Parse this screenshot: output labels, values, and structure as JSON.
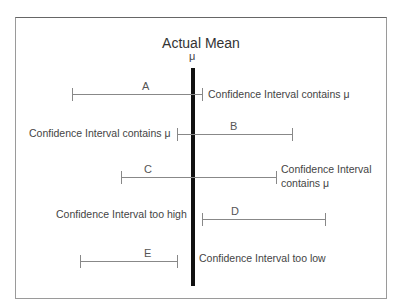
{
  "figure": {
    "title": "Actual Mean",
    "mean_symbol": "μ",
    "intervals": [
      {
        "id": "A",
        "label": "A",
        "note": "Confidence Interval contains μ",
        "note_side": "right",
        "contains_mean": true
      },
      {
        "id": "B",
        "label": "B",
        "note": "Confidence Interval contains μ",
        "note_side": "left",
        "contains_mean": true
      },
      {
        "id": "C",
        "label": "C",
        "note_line1": "Confidence Interval",
        "note_line2": "contains μ",
        "note_side": "right",
        "contains_mean": true
      },
      {
        "id": "D",
        "label": "D",
        "note": "Confidence Interval too high",
        "note_side": "left",
        "contains_mean": false
      },
      {
        "id": "E",
        "label": "E",
        "note": "Confidence Interval too low",
        "note_side": "right",
        "contains_mean": false
      }
    ]
  }
}
